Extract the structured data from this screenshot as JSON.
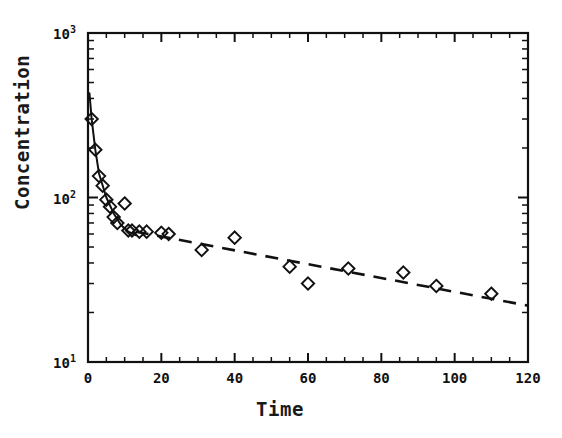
{
  "figure": {
    "background": "#ffffff",
    "ink_color": "#111111",
    "width": 562,
    "height": 438
  },
  "axes": {
    "x_title": "Time",
    "y_title": "Concentration",
    "x_tick_labels": [
      "0",
      "20",
      "40",
      "60",
      "80",
      "100",
      "120"
    ],
    "x_tick_values": [
      0,
      20,
      40,
      60,
      80,
      100,
      120
    ],
    "y_tick_labels": [
      "10¹",
      "10²",
      "10³"
    ],
    "y_tick_mantissa": [
      "10",
      "10",
      "10"
    ],
    "y_tick_exponents": [
      "1",
      "2",
      "3"
    ],
    "y_tick_values": [
      10,
      100,
      1000
    ]
  },
  "chart_data": {
    "type": "scatter",
    "title": "",
    "subtitle": "",
    "xlabel": "Time",
    "ylabel": "Concentration",
    "xlim": [
      0,
      120
    ],
    "ylim": [
      10,
      1000
    ],
    "xscale": "linear",
    "yscale": "log",
    "grid": false,
    "legend": "none",
    "marker": "open-diamond",
    "x": [
      1,
      2,
      3,
      4,
      5,
      6,
      7,
      8,
      10,
      11,
      12,
      14,
      16,
      20,
      22,
      31,
      40,
      55,
      60,
      71,
      86,
      95,
      110
    ],
    "y": [
      300,
      195,
      135,
      118,
      97,
      88,
      76,
      70,
      92,
      63,
      63,
      62,
      62,
      61,
      60,
      48,
      57,
      38,
      30,
      37,
      35,
      29,
      26
    ],
    "points": [
      {
        "x": 1,
        "y": 300
      },
      {
        "x": 2,
        "y": 195
      },
      {
        "x": 3,
        "y": 135
      },
      {
        "x": 4,
        "y": 118
      },
      {
        "x": 5,
        "y": 97
      },
      {
        "x": 6,
        "y": 88
      },
      {
        "x": 7,
        "y": 76
      },
      {
        "x": 8,
        "y": 70
      },
      {
        "x": 10,
        "y": 92
      },
      {
        "x": 11,
        "y": 63
      },
      {
        "x": 12,
        "y": 63
      },
      {
        "x": 14,
        "y": 62
      },
      {
        "x": 16,
        "y": 62
      },
      {
        "x": 20,
        "y": 61
      },
      {
        "x": 22,
        "y": 60
      },
      {
        "x": 31,
        "y": 48
      },
      {
        "x": 40,
        "y": 57
      },
      {
        "x": 55,
        "y": 38
      },
      {
        "x": 60,
        "y": 30
      },
      {
        "x": 71,
        "y": 37
      },
      {
        "x": 86,
        "y": 35
      },
      {
        "x": 95,
        "y": 29
      },
      {
        "x": 110,
        "y": 26
      }
    ],
    "series": [
      {
        "name": "observed concentrations",
        "style": "open-diamond markers",
        "values": [
          300,
          195,
          135,
          118,
          97,
          88,
          76,
          70,
          92,
          63,
          63,
          62,
          62,
          61,
          60,
          48,
          57,
          38,
          30,
          37,
          35,
          29,
          26
        ]
      },
      {
        "name": "distribution phase fit",
        "style": "solid-line",
        "x": [
          0.4,
          1,
          2,
          3,
          5,
          7,
          9,
          11,
          13
        ],
        "y": [
          430,
          300,
          195,
          140,
          100,
          80,
          68,
          62,
          59
        ]
      },
      {
        "name": "terminal elimination fit",
        "style": "dashed-line",
        "x": [
          13,
          120
        ],
        "y": [
          62,
          22
        ]
      }
    ],
    "annotations": []
  }
}
